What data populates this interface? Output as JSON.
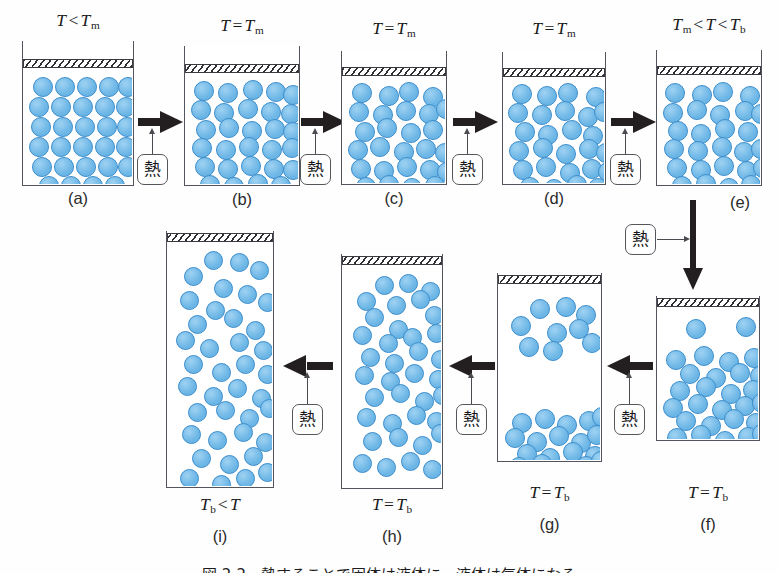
{
  "figure": {
    "caption": "図 2-2　熱することで固体は液体に、液体は気体になる",
    "heat_label": "熱",
    "particle_color": "#6cb6e6",
    "particle_border_color": "#3f8fcc",
    "arrow_color": "#231f20",
    "beaker_border_color": "#54545c"
  },
  "panels": [
    {
      "id": "a",
      "label": "(a)",
      "temp_parts": {
        "lhs": "T",
        "lhs_sub": "",
        "op": "<",
        "rhs": "T",
        "rhs_sub": "m"
      },
      "temp_text": "T < Tm",
      "state": "solid",
      "x": 22,
      "y": 41,
      "w": 112,
      "h": 145
    },
    {
      "id": "b",
      "label": "(b)",
      "temp_parts": {
        "lhs": "T",
        "lhs_sub": "",
        "op": "=",
        "rhs": "T",
        "rhs_sub": "m"
      },
      "temp_text": "T = Tm",
      "state": "solid-loosening",
      "x": 184,
      "y": 46,
      "w": 116,
      "h": 140
    },
    {
      "id": "c",
      "label": "(c)",
      "temp_parts": {
        "lhs": "T",
        "lhs_sub": "",
        "op": "=",
        "rhs": "T",
        "rhs_sub": "m"
      },
      "temp_text": "T = Tm",
      "state": "melting",
      "x": 341,
      "y": 51,
      "w": 106,
      "h": 134
    },
    {
      "id": "d",
      "label": "(d)",
      "temp_parts": {
        "lhs": "T",
        "lhs_sub": "",
        "op": "=",
        "rhs": "T",
        "rhs_sub": "m"
      },
      "temp_text": "T = Tm",
      "state": "liquid",
      "x": 502,
      "y": 52,
      "w": 104,
      "h": 133
    },
    {
      "id": "e",
      "label": "(e)",
      "temp_parts": {
        "lhs": "T",
        "lhs_sub": "m",
        "op": "<",
        "rhs": "T",
        "rhs_sub": "",
        "op2": "<",
        "rhs2": "T",
        "rhs2_sub": "b"
      },
      "temp_text": "Tm < T < Tb",
      "state": "liquid-warm",
      "x": 656,
      "y": 50,
      "w": 106,
      "h": 136
    },
    {
      "id": "f",
      "label": "(f)",
      "temp_parts": {
        "lhs": "T",
        "lhs_sub": "",
        "op": "=",
        "rhs": "T",
        "rhs_sub": "b"
      },
      "temp_text": "T = Tb",
      "state": "boiling-start",
      "x": 656,
      "y": 296,
      "w": 104,
      "h": 145
    },
    {
      "id": "g",
      "label": "(g)",
      "temp_parts": {
        "lhs": "T",
        "lhs_sub": "",
        "op": "=",
        "rhs": "T",
        "rhs_sub": "b"
      },
      "temp_text": "T = Tb",
      "state": "boiling-mixed",
      "x": 497,
      "y": 273,
      "w": 105,
      "h": 189
    },
    {
      "id": "h",
      "label": "(h)",
      "temp_parts": {
        "lhs": "T",
        "lhs_sub": "",
        "op": "=",
        "rhs": "T",
        "rhs_sub": "b"
      },
      "temp_text": "T = Tb",
      "state": "mostly-gas",
      "x": 341,
      "y": 254,
      "w": 102,
      "h": 235
    },
    {
      "id": "i",
      "label": "(i)",
      "temp_parts": {
        "lhs": "T",
        "lhs_sub": "b",
        "op": "<",
        "rhs": "T",
        "rhs_sub": ""
      },
      "temp_text": "Tb < T",
      "state": "gas",
      "x": 166,
      "y": 231,
      "w": 108,
      "h": 257
    }
  ],
  "arrows": [
    {
      "id": "a-to-b",
      "dir": "right",
      "from": "a",
      "to": "b",
      "has_heat": true
    },
    {
      "id": "b-to-c",
      "dir": "right",
      "from": "b",
      "to": "c",
      "has_heat": true
    },
    {
      "id": "c-to-d",
      "dir": "right",
      "from": "c",
      "to": "d",
      "has_heat": true
    },
    {
      "id": "d-to-e",
      "dir": "right",
      "from": "d",
      "to": "e",
      "has_heat": true
    },
    {
      "id": "e-to-f",
      "dir": "down",
      "from": "e",
      "to": "f",
      "has_heat": true
    },
    {
      "id": "f-to-g",
      "dir": "left",
      "from": "f",
      "to": "g",
      "has_heat": true
    },
    {
      "id": "g-to-h",
      "dir": "left",
      "from": "g",
      "to": "h",
      "has_heat": true
    },
    {
      "id": "h-to-i",
      "dir": "left",
      "from": "h",
      "to": "i",
      "has_heat": true
    }
  ],
  "particle_layouts": {
    "a": [
      [
        9,
        8
      ],
      [
        31,
        8
      ],
      [
        53,
        8
      ],
      [
        75,
        8
      ],
      [
        94,
        8
      ],
      [
        5,
        28
      ],
      [
        27,
        28
      ],
      [
        49,
        28
      ],
      [
        71,
        28
      ],
      [
        92,
        28
      ],
      [
        7,
        48
      ],
      [
        29,
        48
      ],
      [
        51,
        48
      ],
      [
        73,
        48
      ],
      [
        93,
        48
      ],
      [
        5,
        68
      ],
      [
        27,
        68
      ],
      [
        49,
        68
      ],
      [
        71,
        68
      ],
      [
        92,
        68
      ],
      [
        8,
        88
      ],
      [
        30,
        88
      ],
      [
        52,
        88
      ],
      [
        74,
        88
      ],
      [
        94,
        88
      ],
      [
        15,
        107
      ],
      [
        37,
        107
      ],
      [
        59,
        107
      ],
      [
        81,
        107
      ]
    ],
    "b": [
      [
        8,
        7
      ],
      [
        32,
        9
      ],
      [
        57,
        6
      ],
      [
        80,
        8
      ],
      [
        97,
        11
      ],
      [
        5,
        26
      ],
      [
        28,
        29
      ],
      [
        52,
        25
      ],
      [
        75,
        28
      ],
      [
        95,
        30
      ],
      [
        10,
        46
      ],
      [
        33,
        44
      ],
      [
        56,
        47
      ],
      [
        79,
        45
      ],
      [
        97,
        48
      ],
      [
        6,
        64
      ],
      [
        30,
        66
      ],
      [
        53,
        63
      ],
      [
        76,
        66
      ],
      [
        96,
        64
      ],
      [
        9,
        83
      ],
      [
        32,
        85
      ],
      [
        55,
        82
      ],
      [
        78,
        85
      ],
      [
        97,
        86
      ],
      [
        14,
        101
      ],
      [
        38,
        103
      ],
      [
        62,
        100
      ],
      [
        85,
        102
      ]
    ],
    "c": [
      [
        9,
        6
      ],
      [
        36,
        9
      ],
      [
        56,
        5
      ],
      [
        80,
        10
      ],
      [
        6,
        25
      ],
      [
        30,
        28
      ],
      [
        53,
        24
      ],
      [
        76,
        27
      ],
      [
        93,
        22
      ],
      [
        12,
        45
      ],
      [
        34,
        41
      ],
      [
        58,
        46
      ],
      [
        80,
        43
      ],
      [
        5,
        63
      ],
      [
        27,
        60
      ],
      [
        51,
        65
      ],
      [
        73,
        62
      ],
      [
        92,
        66
      ],
      [
        8,
        82
      ],
      [
        31,
        84
      ],
      [
        54,
        80
      ],
      [
        77,
        83
      ],
      [
        94,
        85
      ],
      [
        13,
        100
      ],
      [
        36,
        98
      ],
      [
        59,
        101
      ],
      [
        82,
        99
      ]
    ],
    "d": [
      [
        8,
        6
      ],
      [
        33,
        8
      ],
      [
        54,
        5
      ],
      [
        82,
        9
      ],
      [
        4,
        25
      ],
      [
        28,
        27
      ],
      [
        51,
        23
      ],
      [
        74,
        29
      ],
      [
        90,
        24
      ],
      [
        11,
        44
      ],
      [
        34,
        47
      ],
      [
        58,
        42
      ],
      [
        79,
        48
      ],
      [
        5,
        63
      ],
      [
        29,
        60
      ],
      [
        52,
        66
      ],
      [
        75,
        61
      ],
      [
        92,
        65
      ],
      [
        9,
        82
      ],
      [
        32,
        79
      ],
      [
        56,
        85
      ],
      [
        78,
        81
      ],
      [
        94,
        84
      ],
      [
        16,
        99
      ],
      [
        40,
        101
      ],
      [
        63,
        97
      ],
      [
        84,
        100
      ]
    ],
    "e": [
      [
        7,
        7
      ],
      [
        34,
        9
      ],
      [
        55,
        6
      ],
      [
        82,
        10
      ],
      [
        5,
        27
      ],
      [
        29,
        24
      ],
      [
        52,
        29
      ],
      [
        77,
        25
      ],
      [
        93,
        28
      ],
      [
        10,
        45
      ],
      [
        33,
        48
      ],
      [
        57,
        43
      ],
      [
        80,
        46
      ],
      [
        6,
        63
      ],
      [
        30,
        65
      ],
      [
        54,
        61
      ],
      [
        76,
        66
      ],
      [
        93,
        63
      ],
      [
        9,
        82
      ],
      [
        33,
        84
      ],
      [
        56,
        80
      ],
      [
        79,
        85
      ],
      [
        95,
        82
      ],
      [
        14,
        100
      ],
      [
        38,
        98
      ],
      [
        61,
        102
      ],
      [
        83,
        99
      ]
    ],
    "f": [
      [
        28,
        11
      ],
      [
        78,
        9
      ],
      [
        8,
        42
      ],
      [
        36,
        38
      ],
      [
        61,
        44
      ],
      [
        86,
        40
      ],
      [
        22,
        56
      ],
      [
        48,
        60
      ],
      [
        72,
        55
      ],
      [
        92,
        58
      ],
      [
        12,
        73
      ],
      [
        38,
        69
      ],
      [
        63,
        76
      ],
      [
        85,
        72
      ],
      [
        5,
        90
      ],
      [
        30,
        86
      ],
      [
        54,
        92
      ],
      [
        77,
        88
      ],
      [
        94,
        85
      ],
      [
        18,
        103
      ],
      [
        43,
        108
      ],
      [
        66,
        101
      ],
      [
        88,
        105
      ],
      [
        9,
        120
      ],
      [
        33,
        117
      ],
      [
        57,
        123
      ],
      [
        80,
        119
      ],
      [
        94,
        116
      ]
    ],
    "g": [
      [
        31,
        14
      ],
      [
        57,
        12
      ],
      [
        77,
        20
      ],
      [
        12,
        31
      ],
      [
        48,
        38
      ],
      [
        70,
        34
      ],
      [
        20,
        52
      ],
      [
        44,
        56
      ],
      [
        83,
        48
      ],
      [
        13,
        128
      ],
      [
        36,
        124
      ],
      [
        58,
        130
      ],
      [
        80,
        126
      ],
      [
        93,
        122
      ],
      [
        6,
        143
      ],
      [
        28,
        147
      ],
      [
        50,
        141
      ],
      [
        72,
        148
      ],
      [
        88,
        140
      ],
      [
        18,
        159
      ],
      [
        41,
        163
      ],
      [
        64,
        157
      ],
      [
        86,
        161
      ],
      [
        10,
        172
      ],
      [
        33,
        169
      ],
      [
        55,
        175
      ],
      [
        77,
        171
      ],
      [
        92,
        166
      ]
    ],
    "h": [
      [
        32,
        10
      ],
      [
        56,
        8
      ],
      [
        78,
        16
      ],
      [
        14,
        26
      ],
      [
        44,
        30
      ],
      [
        68,
        24
      ],
      [
        22,
        42
      ],
      [
        46,
        54
      ],
      [
        82,
        40
      ],
      [
        10,
        60
      ],
      [
        36,
        68
      ],
      [
        60,
        62
      ],
      [
        84,
        58
      ],
      [
        18,
        82
      ],
      [
        42,
        88
      ],
      [
        66,
        76
      ],
      [
        88,
        84
      ],
      [
        12,
        100
      ],
      [
        38,
        106
      ],
      [
        62,
        98
      ],
      [
        86,
        104
      ],
      [
        22,
        122
      ],
      [
        48,
        118
      ],
      [
        72,
        126
      ],
      [
        90,
        120
      ],
      [
        14,
        142
      ],
      [
        40,
        148
      ],
      [
        64,
        140
      ],
      [
        84,
        146
      ],
      [
        20,
        166
      ],
      [
        46,
        162
      ],
      [
        70,
        170
      ],
      [
        88,
        158
      ],
      [
        10,
        188
      ],
      [
        34,
        192
      ],
      [
        58,
        186
      ],
      [
        80,
        194
      ]
    ],
    "i": [
      [
        36,
        8
      ],
      [
        62,
        10
      ],
      [
        16,
        24
      ],
      [
        82,
        18
      ],
      [
        46,
        36
      ],
      [
        70,
        42
      ],
      [
        12,
        48
      ],
      [
        38,
        58
      ],
      [
        90,
        50
      ],
      [
        20,
        72
      ],
      [
        56,
        66
      ],
      [
        78,
        78
      ],
      [
        8,
        88
      ],
      [
        32,
        96
      ],
      [
        62,
        90
      ],
      [
        86,
        98
      ],
      [
        16,
        112
      ],
      [
        44,
        120
      ],
      [
        68,
        112
      ],
      [
        90,
        122
      ],
      [
        10,
        134
      ],
      [
        36,
        144
      ],
      [
        60,
        136
      ],
      [
        84,
        146
      ],
      [
        20,
        160
      ],
      [
        48,
        158
      ],
      [
        72,
        166
      ],
      [
        92,
        156
      ],
      [
        14,
        182
      ],
      [
        40,
        188
      ],
      [
        66,
        180
      ],
      [
        88,
        190
      ],
      [
        24,
        206
      ],
      [
        52,
        212
      ],
      [
        76,
        204
      ],
      [
        12,
        226
      ],
      [
        44,
        232
      ],
      [
        68,
        226
      ],
      [
        90,
        220
      ]
    ]
  }
}
